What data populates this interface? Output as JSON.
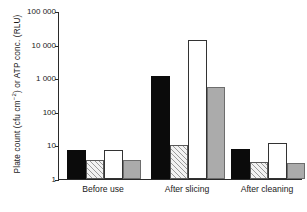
{
  "chart_data": {
    "type": "bar",
    "title": "",
    "subtitle": "",
    "xlabel": "",
    "ylabel": "Plate count (cfu cm-2) or ATP conc. (RLU)",
    "ylabel_parts": {
      "pre": "Plate count (cfu cm",
      "sup": "−2",
      "post": ") or ATP conc. (RLU)"
    },
    "yscale": "log",
    "ylim": [
      1,
      100000
    ],
    "ytick_labels": [
      "100 000",
      "10 000",
      "1 000",
      "100",
      "10",
      "1"
    ],
    "ytick_values": [
      100000,
      10000,
      1000,
      100,
      10,
      1
    ],
    "grid": false,
    "legend": "none",
    "categories": [
      "Before use",
      "After slicing",
      "After cleaning"
    ],
    "series": [
      {
        "name": "black",
        "fill": "black",
        "values": [
          7.5,
          1150,
          8.0
        ]
      },
      {
        "name": "hatched",
        "fill": "hatched",
        "values": [
          3.7,
          10.5,
          3.2
        ]
      },
      {
        "name": "white",
        "fill": "white",
        "values": [
          7.5,
          13500,
          12.0
        ]
      },
      {
        "name": "gray",
        "fill": "gray",
        "values": [
          3.6,
          550,
          3.0
        ]
      }
    ]
  },
  "colors": {
    "black": "#0b0b0b",
    "white": "#ffffff",
    "gray": "#ababab",
    "hatch": "#f2f2f2",
    "axis": "#2a2a2a",
    "background": "#ffffff"
  }
}
